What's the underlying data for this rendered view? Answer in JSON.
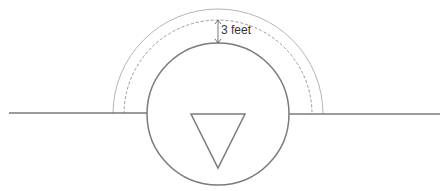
{
  "diagram": {
    "type": "clearance-diagram",
    "annotation": {
      "text": "3 feet"
    },
    "elements": {
      "baseline": {
        "description": "horizontal line / pipe",
        "color": "#7a7a7a"
      },
      "circle": {
        "description": "main circular component",
        "color": "#7a7a7a"
      },
      "triangle": {
        "description": "inverted triangle symbol",
        "color": "#7a7a7a"
      },
      "clearance_arc_outer": {
        "description": "outer semicircle boundary",
        "color": "#b5b5b5"
      },
      "clearance_arc_dashed": {
        "description": "dashed semicircle boundary",
        "color": "#9a9a9a"
      },
      "dimension_arrow": {
        "description": "double-headed vertical arrow",
        "color": "#555555"
      }
    }
  }
}
